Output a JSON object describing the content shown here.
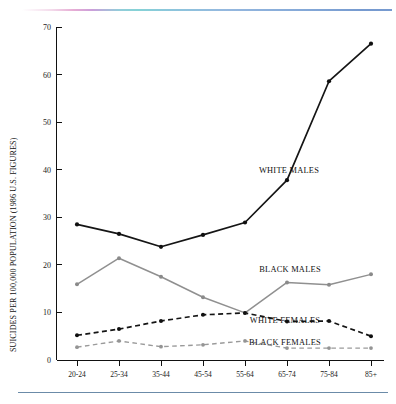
{
  "chart_data": {
    "type": "line",
    "title": "",
    "xlabel": "",
    "ylabel": "SUICIDES PER 100,000 POPULATION (1986 U.S. FIGURES)",
    "categories": [
      "20-24",
      "25-34",
      "35-44",
      "45-54",
      "55-64",
      "65-74",
      "75-84",
      "85+"
    ],
    "ylim": [
      0,
      70
    ],
    "yticks": [
      0,
      10,
      20,
      30,
      40,
      50,
      60,
      70
    ],
    "ytick_labels": [
      "0",
      "10",
      "20",
      "30",
      "40",
      "50",
      "60",
      "70"
    ],
    "grid": false,
    "legend_position": "inline-right-annotations",
    "series": [
      {
        "name": "WHITE MALES",
        "values": [
          28.5,
          26.5,
          23.8,
          26.3,
          28.9,
          37.8,
          58.6,
          66.5
        ],
        "color": "#151515",
        "style": "solid"
      },
      {
        "name": "BLACK MALES",
        "values": [
          15.9,
          21.4,
          17.5,
          13.2,
          9.9,
          16.3,
          15.8,
          18.0
        ],
        "color": "#909090",
        "style": "solid"
      },
      {
        "name": "WHITE FEMALES",
        "values": [
          5.2,
          6.5,
          8.2,
          9.5,
          9.9,
          8.1,
          8.2,
          5.0
        ],
        "color": "#151515",
        "style": "dashed"
      },
      {
        "name": "BLACK FEMALES",
        "values": [
          2.7,
          4.0,
          2.8,
          3.2,
          4.0,
          2.5,
          2.5,
          2.5
        ],
        "color": "#9a9a9a",
        "style": "dashed"
      }
    ],
    "annotations": [
      {
        "text": "WHITE MALES",
        "x": 289,
        "y": 173
      },
      {
        "text": "BLACK MALES",
        "x": 290,
        "y": 272
      },
      {
        "text": "WHITE FEMALES",
        "x": 285,
        "y": 323
      },
      {
        "text": "BLACK FEMALES",
        "x": 285,
        "y": 345
      }
    ]
  }
}
